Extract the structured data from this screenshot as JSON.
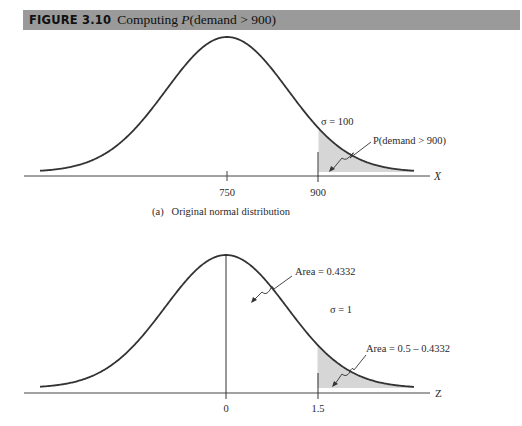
{
  "figure": {
    "number": "FIGURE 3.10",
    "title_prefix": "Computing ",
    "title_italic": "P",
    "title_suffix": "(demand > 900)"
  },
  "panels": [
    {
      "id": "a",
      "caption": "(a)   Original normal distribution",
      "axis_label": "X",
      "ticks": [
        "750",
        "900"
      ],
      "sigma_label": "σ = 100",
      "annotations": [
        "P(demand > 900)"
      ]
    },
    {
      "id": "b",
      "caption": "",
      "axis_label": "Z",
      "ticks": [
        "0",
        "1.5"
      ],
      "sigma_label": "σ = 1",
      "annotations": [
        "Area = 0.4332",
        "Area = 0.5 – 0.4332"
      ]
    }
  ],
  "colors": {
    "title_bar": "#9a9a9a",
    "curve": "#333333",
    "shade": "#d6d6d6"
  },
  "chart_data": [
    {
      "type": "area",
      "title": "Original normal distribution",
      "xlabel": "X",
      "distribution": "normal",
      "mean": 750,
      "sigma": 100,
      "tick_labels": [
        "750",
        "900"
      ],
      "shaded_region": {
        "from": 900,
        "to": "inf",
        "label": "P(demand > 900)"
      },
      "annotations": [
        "σ = 100",
        "P(demand > 900)"
      ]
    },
    {
      "type": "area",
      "title": "Standard normal distribution",
      "xlabel": "Z",
      "distribution": "normal",
      "mean": 0,
      "sigma": 1,
      "tick_labels": [
        "0",
        "1.5"
      ],
      "shaded_region": {
        "from": 1.5,
        "to": "inf",
        "label": "Area = 0.5 – 0.4332"
      },
      "areas": [
        {
          "from": 0,
          "to": 1.5,
          "value": 0.4332,
          "label": "Area = 0.4332"
        },
        {
          "from": 1.5,
          "to": "inf",
          "value": 0.0668,
          "label": "Area = 0.5 – 0.4332"
        }
      ],
      "annotations": [
        "σ = 1",
        "Area = 0.4332",
        "Area = 0.5 – 0.4332"
      ]
    }
  ]
}
